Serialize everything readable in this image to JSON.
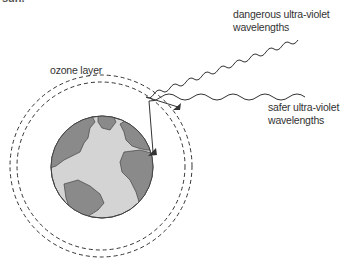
{
  "diagram": {
    "clipped_top_text": "sun.",
    "labels": {
      "ozone": "ozone layer",
      "dangerous_line1": "dangerous ultra-violet",
      "dangerous_line2": "wavelengths",
      "safer_line1": "safer ultra-violet",
      "safer_line2": "wavelengths"
    },
    "elements": {
      "earth": "globe-icon",
      "ozone_layer": "dashed-concentric-circles",
      "dangerous_wave": "wavy-arrow stops at ozone layer",
      "safer_wave": "wavy-arrow passes through to earth"
    },
    "colors": {
      "land": "#8a8a8a",
      "ocean": "#d4d4d4",
      "stroke": "#333333"
    }
  }
}
